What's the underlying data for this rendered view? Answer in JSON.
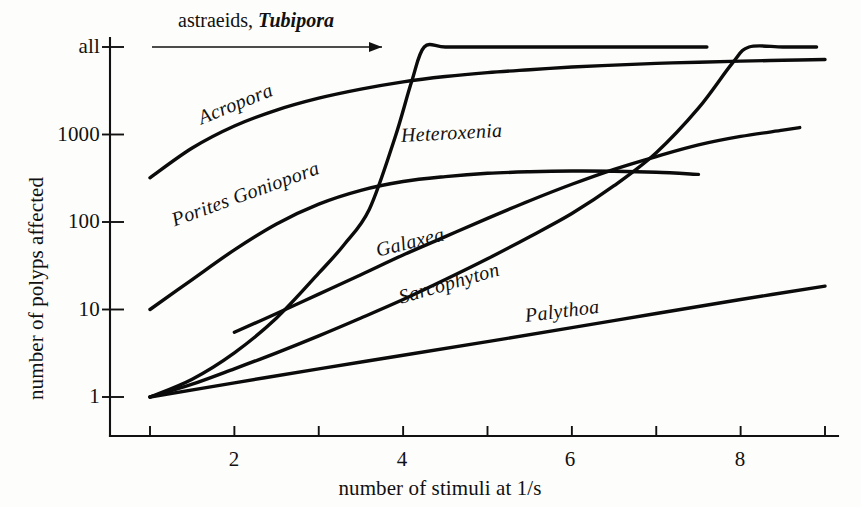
{
  "figure": {
    "background_color": "#fdfdfb",
    "ink_color": "#111111"
  },
  "axes": {
    "x_title": "number of stimuli at 1/s",
    "y_title": "number of polyps affected",
    "x_tick_labels": [
      "2",
      "4",
      "6",
      "8"
    ],
    "y_tick_labels": [
      "all",
      "1000",
      "100",
      "10",
      "1"
    ]
  },
  "annotation": {
    "text_plain": "astraeids,",
    "text_italic": "Tubipora",
    "arrow": "arrow-right"
  },
  "curve_labels": {
    "acropora": "Acropora",
    "porites_goniopora": "Porites Goniopora",
    "heteroxenia": "Heteroxenia",
    "galaxea": "Galaxea",
    "sarcophyton": "Sarcophyton",
    "palythoa": "Palythoa"
  },
  "chart_data": {
    "type": "line",
    "title": "",
    "xlabel": "number of stimuli at 1/s",
    "ylabel": "number of polyps affected",
    "xlim": [
      1,
      9
    ],
    "ylim": [
      1,
      10000
    ],
    "yscale": "log",
    "y_tick_values": [
      1,
      10,
      100,
      1000,
      10000
    ],
    "y_tick_labels": [
      "1",
      "10",
      "100",
      "1000",
      "all"
    ],
    "x_tick_values": [
      1,
      2,
      3,
      4,
      5,
      6,
      7,
      8,
      9
    ],
    "x_tick_labels_shown": [
      "",
      "2",
      "",
      "4",
      "",
      "6",
      "",
      "8",
      ""
    ],
    "grid": false,
    "legend": "inline-curve-labels",
    "annotations": [
      {
        "text": "astraeids, Tubipora",
        "type": "arrow-right",
        "y_value": 10000,
        "x_from": 1.5,
        "x_to": 4.3
      }
    ],
    "series": [
      {
        "name": "Acropora",
        "label_position": "on-curve-upper-left",
        "x": [
          1,
          1.5,
          2,
          2.5,
          3,
          3.5,
          4,
          4.5,
          5,
          5.5,
          6,
          6.5,
          7,
          7.5,
          8,
          8.5,
          9
        ],
        "y": [
          320,
          700,
          1250,
          1900,
          2600,
          3300,
          4000,
          4600,
          5100,
          5500,
          5900,
          6200,
          6500,
          6700,
          6900,
          7050,
          7200
        ]
      },
      {
        "name": "Porites Goniopora",
        "label_position": "on-curve-mid-left",
        "x": [
          1,
          1.5,
          2,
          2.5,
          3,
          3.5,
          4,
          4.5,
          5,
          5.5,
          6,
          6.5,
          7,
          7.5
        ],
        "y": [
          10,
          22,
          48,
          95,
          160,
          230,
          290,
          330,
          360,
          375,
          382,
          380,
          370,
          350
        ]
      },
      {
        "name": "Heteroxenia",
        "label_position": "right-of-steep-rise",
        "x": [
          1,
          1.5,
          2,
          2.5,
          3,
          3.3,
          3.6,
          3.9,
          4.1,
          4.25,
          4.5,
          5,
          6,
          7,
          7.6
        ],
        "y": [
          1,
          1.6,
          3.2,
          8,
          26,
          55,
          140,
          900,
          4000,
          10000,
          10000,
          10000,
          10000,
          10000,
          10000
        ]
      },
      {
        "name": "Galaxea",
        "label_position": "on-curve-lower-mid",
        "x": [
          2,
          2.5,
          3,
          3.5,
          4,
          4.5,
          5,
          5.5,
          6,
          6.5,
          7,
          7.5,
          8,
          8.5,
          8.7
        ],
        "y": [
          5.5,
          9,
          15,
          25,
          42,
          68,
          110,
          175,
          270,
          400,
          560,
          760,
          950,
          1120,
          1200
        ]
      },
      {
        "name": "Sarcophyton",
        "label_position": "on-curve-lower-mid",
        "x": [
          1,
          1.5,
          2,
          2.5,
          3,
          3.5,
          4,
          4.5,
          5,
          5.5,
          6,
          6.5,
          7,
          7.5,
          7.9,
          8.1,
          8.5,
          8.9
        ],
        "y": [
          1,
          1.4,
          2.1,
          3.2,
          5.0,
          8.0,
          13,
          22,
          38,
          68,
          125,
          260,
          620,
          2000,
          6500,
          10000,
          10000,
          10000
        ]
      },
      {
        "name": "Palythoa",
        "label_position": "above-line-right",
        "x": [
          1,
          2,
          3,
          4,
          5,
          6,
          7,
          8,
          9
        ],
        "y": [
          1,
          1.45,
          2.1,
          3.0,
          4.3,
          6.2,
          9.0,
          13.0,
          18.5
        ]
      }
    ]
  }
}
